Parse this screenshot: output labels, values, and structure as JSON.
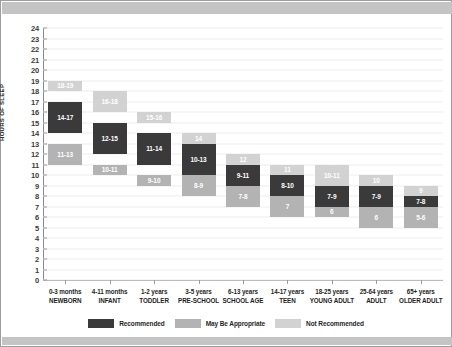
{
  "chart_data": {
    "type": "bar",
    "title": "",
    "xlabel": "",
    "ylabel": "HOURS OF SLEEP",
    "ylim": [
      0,
      24
    ],
    "ytick_step": 1,
    "grid": true,
    "legend_position": "bottom",
    "yticks": [
      "24",
      "23",
      "22",
      "21",
      "20",
      "19",
      "18",
      "17",
      "16",
      "15",
      "14",
      "13",
      "12",
      "11",
      "10",
      "9",
      "8",
      "7",
      "6",
      "5",
      "4",
      "3",
      "2",
      "1",
      "0"
    ],
    "legend": [
      {
        "key": "recommended",
        "label": "Recommended",
        "color": "#3a3a3a"
      },
      {
        "key": "may_be_appropriate",
        "label": "May Be Appropriate",
        "color": "#b3b3b3"
      },
      {
        "key": "not_recommended",
        "label": "Not Recommended",
        "color": "#d2d2d2"
      }
    ],
    "categories": [
      {
        "age": "0-3 months",
        "group": "NEWBORN"
      },
      {
        "age": "4-11 months",
        "group": "INFANT"
      },
      {
        "age": "1-2 years",
        "group": "TODDLER"
      },
      {
        "age": "3-5 years",
        "group": "PRE-SCHOOL"
      },
      {
        "age": "6-13 years",
        "group": "SCHOOL AGE"
      },
      {
        "age": "14-17 years",
        "group": "TEEN"
      },
      {
        "age": "18-25 years",
        "group": "YOUNG ADULT"
      },
      {
        "age": "25-64 years",
        "group": "ADULT"
      },
      {
        "age": "65+ years",
        "group": "OLDER ADULT"
      }
    ],
    "series": [
      {
        "category": "NEWBORN",
        "upper_not_recommended": {
          "label": "18-19",
          "min": 18,
          "max": 19
        },
        "recommended": {
          "label": "14-17",
          "min": 14,
          "max": 17
        },
        "lower_may_be_appropriate": {
          "label": "11-13",
          "min": 11,
          "max": 13
        }
      },
      {
        "category": "INFANT",
        "upper_not_recommended": {
          "label": "16-18",
          "min": 16,
          "max": 18
        },
        "recommended": {
          "label": "12-15",
          "min": 12,
          "max": 15
        },
        "lower_may_be_appropriate": {
          "label": "10-11",
          "min": 10,
          "max": 11
        }
      },
      {
        "category": "TODDLER",
        "upper_not_recommended": {
          "label": "15-16",
          "min": 15,
          "max": 16
        },
        "recommended": {
          "label": "11-14",
          "min": 11,
          "max": 14
        },
        "lower_may_be_appropriate": {
          "label": "9-10",
          "min": 9,
          "max": 10
        }
      },
      {
        "category": "PRE-SCHOOL",
        "upper_not_recommended": {
          "label": "14",
          "min": 13,
          "max": 14
        },
        "recommended": {
          "label": "10-13",
          "min": 10,
          "max": 13
        },
        "lower_may_be_appropriate": {
          "label": "8-9",
          "min": 8,
          "max": 10
        }
      },
      {
        "category": "SCHOOL AGE",
        "upper_not_recommended": {
          "label": "12",
          "min": 11,
          "max": 12
        },
        "recommended": {
          "label": "9-11",
          "min": 9,
          "max": 11
        },
        "lower_may_be_appropriate": {
          "label": "7-8",
          "min": 7,
          "max": 9
        }
      },
      {
        "category": "TEEN",
        "upper_not_recommended": {
          "label": "11",
          "min": 10,
          "max": 11
        },
        "recommended": {
          "label": "8-10",
          "min": 8,
          "max": 10
        },
        "lower_may_be_appropriate": {
          "label": "7",
          "min": 6,
          "max": 8
        }
      },
      {
        "category": "YOUNG ADULT",
        "upper_not_recommended": {
          "label": "10-11",
          "min": 9,
          "max": 11
        },
        "recommended": {
          "label": "7-9",
          "min": 7,
          "max": 9
        },
        "lower_may_be_appropriate": {
          "label": "6",
          "min": 6,
          "max": 7
        }
      },
      {
        "category": "ADULT",
        "upper_not_recommended": {
          "label": "10",
          "min": 9,
          "max": 10
        },
        "recommended": {
          "label": "7-9",
          "min": 7,
          "max": 9
        },
        "lower_may_be_appropriate": {
          "label": "6",
          "min": 5,
          "max": 7
        }
      },
      {
        "category": "OLDER ADULT",
        "upper_not_recommended": {
          "label": "9",
          "min": 8,
          "max": 9
        },
        "recommended": {
          "label": "7-8",
          "min": 7,
          "max": 8
        },
        "lower_may_be_appropriate": {
          "label": "5-6",
          "min": 5,
          "max": 7
        }
      }
    ]
  }
}
